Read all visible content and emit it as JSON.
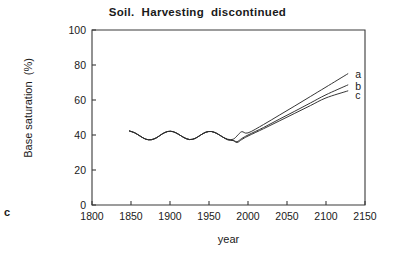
{
  "figure": {
    "panel_label": "c"
  },
  "chart_data": {
    "type": "line",
    "title": "Soil.  Harvesting  discontinued",
    "xlabel": "year",
    "ylabel": "Base saturation  (%)",
    "xlim": [
      1800,
      2150
    ],
    "ylim": [
      0,
      100
    ],
    "xticks": [
      1800,
      1850,
      1900,
      1950,
      2000,
      2050,
      2100,
      2150
    ],
    "xtick_labels": [
      "1800",
      "1850",
      "1900",
      "1950",
      "2000",
      "2050",
      "2100",
      "2150"
    ],
    "yticks": [
      0,
      20,
      40,
      60,
      80,
      100
    ],
    "ytick_labels": [
      "0",
      "20",
      "40",
      "60",
      "80",
      "100"
    ],
    "grid": false,
    "legend": "inline-right-end-labels",
    "annotations": [
      {
        "text": "a",
        "x": 2140,
        "y": 75
      },
      {
        "text": "b",
        "x": 2140,
        "y": 68
      },
      {
        "text": "c",
        "x": 2140,
        "y": 63
      }
    ],
    "series": [
      {
        "name": "a",
        "label": "a",
        "color": "#2b2b2b",
        "x": [
          1848,
          1855,
          1862,
          1869,
          1876,
          1883,
          1890,
          1897,
          1904,
          1911,
          1918,
          1925,
          1932,
          1939,
          1946,
          1953,
          1960,
          1967,
          1974,
          1981,
          1986,
          1992,
          2000,
          2020,
          2040,
          2060,
          2080,
          2100,
          2128
        ],
        "y": [
          42.3,
          41.2,
          39.3,
          37.6,
          37.3,
          38.5,
          40.6,
          42.0,
          41.9,
          40.4,
          38.5,
          37.4,
          38.0,
          39.9,
          41.6,
          42.0,
          40.9,
          39.0,
          37.6,
          37.6,
          39.5,
          41.9,
          41.2,
          46.0,
          51.3,
          56.6,
          62.0,
          67.4,
          75.0
        ]
      },
      {
        "name": "b",
        "label": "b",
        "color": "#2b2b2b",
        "x": [
          1848,
          1855,
          1862,
          1869,
          1876,
          1883,
          1890,
          1897,
          1904,
          1911,
          1918,
          1925,
          1932,
          1939,
          1946,
          1953,
          1960,
          1967,
          1974,
          1981,
          1986,
          1992,
          2000,
          2020,
          2040,
          2060,
          2080,
          2100,
          2128
        ],
        "y": [
          42.3,
          41.2,
          39.3,
          37.6,
          37.3,
          38.5,
          40.6,
          42.0,
          41.9,
          40.4,
          38.5,
          37.4,
          38.0,
          39.9,
          41.6,
          42.0,
          40.9,
          39.0,
          37.3,
          36.9,
          36.2,
          38.0,
          40.0,
          44.3,
          49.0,
          53.6,
          58.3,
          63.0,
          68.6
        ]
      },
      {
        "name": "c",
        "label": "c",
        "color": "#2b2b2b",
        "x": [
          1848,
          1855,
          1862,
          1869,
          1876,
          1883,
          1890,
          1897,
          1904,
          1911,
          1918,
          1925,
          1932,
          1939,
          1946,
          1953,
          1960,
          1967,
          1974,
          1981,
          1986,
          1992,
          2000,
          2020,
          2040,
          2060,
          2080,
          2100,
          2128
        ],
        "y": [
          42.3,
          41.2,
          39.3,
          37.6,
          37.3,
          38.5,
          40.6,
          42.0,
          41.9,
          40.4,
          38.5,
          37.4,
          38.0,
          39.9,
          41.6,
          42.0,
          40.9,
          39.0,
          37.3,
          36.8,
          35.7,
          37.4,
          39.4,
          43.6,
          48.0,
          52.4,
          56.8,
          61.2,
          65.2
        ]
      }
    ]
  }
}
